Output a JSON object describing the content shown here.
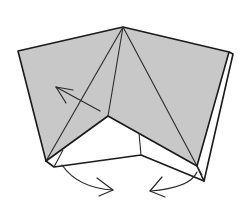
{
  "diagram": {
    "type": "origami-step",
    "colors": {
      "paper_colored_side": "#c8c8c8",
      "paper_white_side": "#ffffff",
      "lines": "#1a1a1a"
    },
    "arrows": [
      {
        "name": "arrow-fold-left-flap",
        "meaning": "swing flap up-left"
      },
      {
        "name": "arrow-curved-left",
        "meaning": "rotate bottom left corner inward"
      },
      {
        "name": "arrow-curved-right",
        "meaning": "rotate bottom right corner inward"
      }
    ]
  }
}
